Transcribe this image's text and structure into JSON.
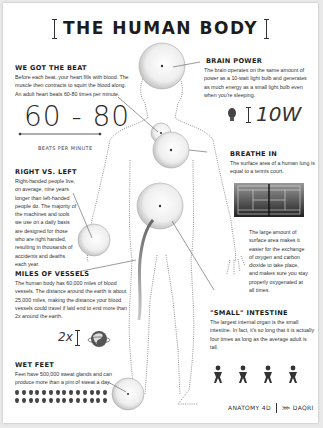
{
  "title": "THE HUMAN BODY",
  "sections": {
    "beat": {
      "heading": "WE GOT THE BEAT",
      "body": "Before each beat, your heart fills with blood. The muscle then contracts to squirt the blood along. An adult heart beats 60-80 times per minute.",
      "stat": "60 - 80",
      "stat_label": "BEATS PER MINUTE"
    },
    "brain": {
      "heading": "BRAIN POWER",
      "body": "The brain operates on the same amount of power as a 10-watt light bulb and generates as much energy as a small light bulb even when you're sleeping.",
      "stat": "10W",
      "icon": "light-bulb-icon"
    },
    "breathe": {
      "heading": "BREATHE IN",
      "body": "The surface area of a human lung is equal to a tennis court.",
      "body2": "The large amount of surface area makes it easier for the exchange of oxygen and carbon dioxide to take place, and makes sure you stay properly oxygenated at all times.",
      "icon": "tennis-court-icon"
    },
    "right_left": {
      "heading": "RIGHT VS. LEFT",
      "body": "Right-handed people live, on average, nine years longer than left-handed people do. The majority of the machines and tools we use on a daily basis are designed for those who are right handed, resulting in thousands of accidents and deaths each year."
    },
    "vessels": {
      "heading": "MILES OF VESSELS",
      "body": "The human body has 60,000 miles of blood vessels. The distance around the earth is about 25,000 miles, making the distance your blood vessels could travel if laid end to end more than 2x around the earth.",
      "stat": "2x",
      "icon": "globe-icon"
    },
    "intestine": {
      "heading": "\"SMALL\" INTESTINE",
      "body": "The largest internal organ is the small intestine. In fact, it's so long that it is actually four times as long as the average adult is tall.",
      "figure_count": 4,
      "icon": "person-icon"
    },
    "feet": {
      "heading": "WET FEET",
      "body": "Feet have 500,000 sweat glands and can produce more than a pint of sweat a day.",
      "drop_rows": 2,
      "drops_per_row": 14,
      "icon": "sweat-drop-icon"
    }
  },
  "footer": {
    "brand1": "ANATOMY 4D",
    "brand2": "DAQRI"
  },
  "colors": {
    "text": "#222222",
    "background": "#ffffff",
    "accent": "#888888"
  }
}
